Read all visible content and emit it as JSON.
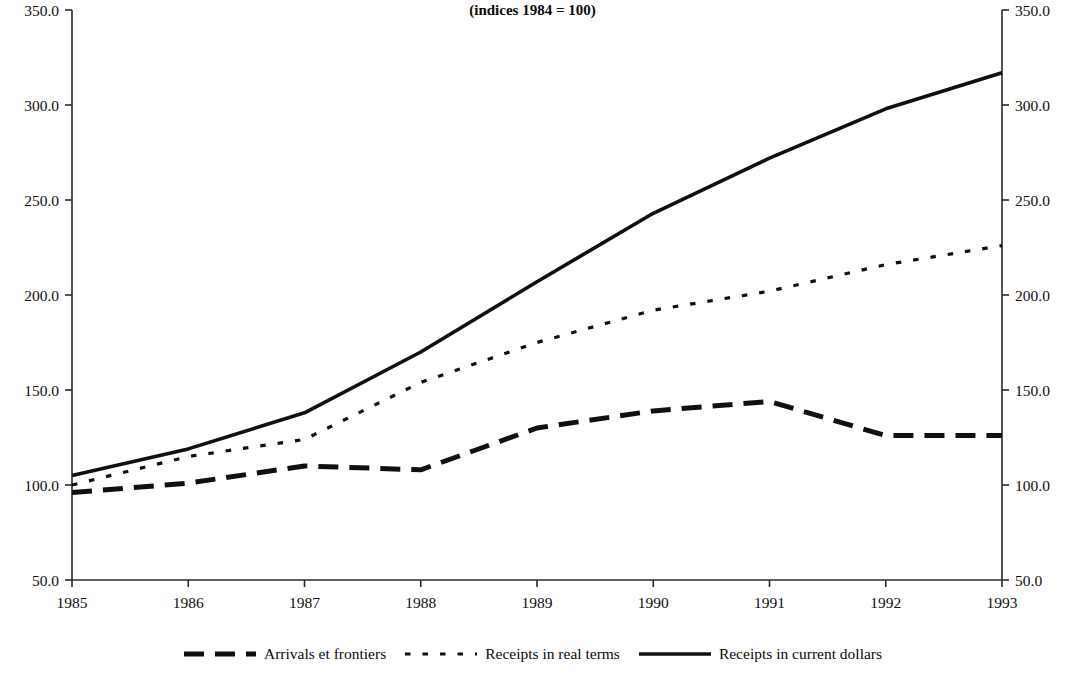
{
  "chart_data": {
    "type": "line",
    "title": "in North America",
    "subtitle": "(indices 1984 = 100)",
    "xlabel": "",
    "ylabel": "",
    "x": [
      1985,
      1986,
      1987,
      1988,
      1989,
      1990,
      1991,
      1992,
      1993
    ],
    "categories": [
      "1985",
      "1986",
      "1987",
      "1988",
      "1989",
      "1990",
      "1991",
      "1992",
      "1993"
    ],
    "xlim": [
      1985,
      1993
    ],
    "ylim": [
      50,
      350
    ],
    "y_ticks": [
      50,
      100,
      150,
      200,
      250,
      300,
      350
    ],
    "y_tick_labels": [
      "50.0",
      "100.0",
      "150.0",
      "200.0",
      "250.0",
      "300.0",
      "350.0"
    ],
    "y_ticks_right": [
      50,
      100,
      150,
      200,
      250,
      300,
      350
    ],
    "y_tick_labels_right": [
      "50.0",
      "100.0",
      "150.0",
      "200.0",
      "250.0",
      "300.0",
      "350.0"
    ],
    "grid": false,
    "legend_position": "bottom",
    "dual_axis": true,
    "series": [
      {
        "name": "Arrivals et frontiers",
        "style": "dashed",
        "color": "#101010",
        "values": [
          96,
          101,
          110,
          108,
          130,
          139,
          144,
          126,
          126
        ]
      },
      {
        "name": "Receipts in real terms",
        "style": "dotted",
        "color": "#101010",
        "values": [
          100,
          115,
          124,
          154,
          175,
          192,
          202,
          216,
          226
        ]
      },
      {
        "name": "Receipts in current dollars",
        "style": "solid",
        "color": "#101010",
        "values": [
          105,
          119,
          138,
          170,
          207,
          243,
          272,
          298,
          317
        ]
      }
    ]
  },
  "legend": {
    "items": [
      {
        "label": "Arrivals et frontiers",
        "style": "dashed"
      },
      {
        "label": "Receipts in real terms",
        "style": "dotted"
      },
      {
        "label": "Receipts in current dollars",
        "style": "solid"
      }
    ]
  }
}
